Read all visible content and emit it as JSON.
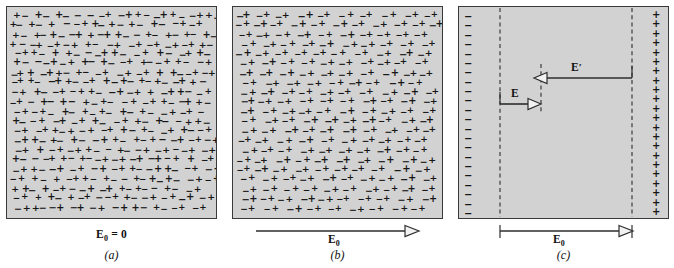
{
  "figure": {
    "background_color": "#ffffff",
    "panel_fill_color": "#d2d2d2",
    "panel_border_color": "#3a3a3a",
    "ink_color": "#161616"
  },
  "panels": [
    {
      "id": "a",
      "label": "(a)",
      "caption": "E₀ = 0",
      "caption_symbol": "E",
      "caption_subscript": "0",
      "caption_suffix": " = 0",
      "state": "random-orientation",
      "has_arrow": false
    },
    {
      "id": "b",
      "label": "(b)",
      "caption": "E₀",
      "caption_symbol": "E",
      "caption_subscript": "0",
      "state": "aligned-dipoles",
      "has_arrow": true,
      "arrow_direction": "right"
    },
    {
      "id": "c",
      "label": "(c)",
      "caption": "E₀",
      "caption_symbol": "E",
      "caption_subscript": "0",
      "state": "surface-charge",
      "has_arrow": true,
      "arrow_direction": "right",
      "left_edge_charge": "−",
      "right_edge_charge": "+",
      "left_edge_count": 22,
      "right_edge_count": 22,
      "internal_vectors": [
        {
          "name": "E",
          "symbol": "E",
          "direction": "right",
          "position": "lower-left"
        },
        {
          "name": "E-prime",
          "symbol": "E",
          "prime": "′",
          "direction": "left",
          "position": "upper-right"
        }
      ]
    }
  ],
  "glyphs": {
    "plus": "+",
    "minus": "−"
  },
  "chart_data": {
    "type": "diagram",
    "panel_count": 3
  }
}
